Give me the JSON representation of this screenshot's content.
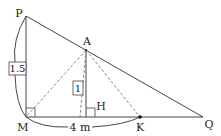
{
  "diagram": {
    "points": {
      "P": {
        "label": "P"
      },
      "A": {
        "label": "A"
      },
      "M": {
        "label": "M"
      },
      "H": {
        "label": "H"
      },
      "K": {
        "label": "K"
      },
      "Q": {
        "label": "Q"
      }
    },
    "measurements": {
      "PM": "1.5",
      "AH": "1",
      "MK": "4 m"
    }
  }
}
